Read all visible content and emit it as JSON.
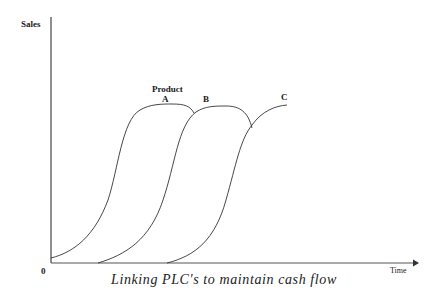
{
  "diagram": {
    "type": "product-life-cycle-overlap",
    "y_axis_label": "Sales",
    "x_axis_label": "Time",
    "origin_label": "0",
    "curve_group_label": "Product",
    "curves": [
      {
        "label": "A"
      },
      {
        "label": "B"
      },
      {
        "label": "C"
      }
    ],
    "caption": "Linking PLC's to maintain cash flow",
    "colors": {
      "line": "#333333",
      "background": "#ffffff"
    }
  }
}
